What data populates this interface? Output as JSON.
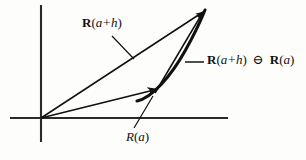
{
  "figure": {
    "kind": "vector-derivative-diagram",
    "background_color": "#fdfdfb",
    "ink_color": "#111111",
    "axes": {
      "vertical": {
        "x": 41,
        "y_top": 5,
        "y_bottom": 142
      },
      "horizontal": {
        "y": 118,
        "x_left": 10,
        "x_right": 228
      },
      "origin": {
        "x": 41,
        "y": 118
      }
    },
    "vectors": [
      {
        "name": "R(a+h)",
        "from": {
          "x": 41,
          "y": 118
        },
        "to": {
          "x": 205,
          "y": 10
        },
        "arrowhead": true
      },
      {
        "name": "R(a)",
        "from": {
          "x": 41,
          "y": 118
        },
        "to": {
          "x": 160,
          "y": 88
        },
        "arrowhead": true
      },
      {
        "name": "R(a+h) minus R(a)",
        "from": {
          "x": 160,
          "y": 88
        },
        "to": {
          "x": 205,
          "y": 10
        },
        "arrowhead": true
      }
    ],
    "curve": {
      "name": "trajectory-curve",
      "start": {
        "x": 137,
        "y": 101
      },
      "end": {
        "x": 205,
        "y": 10
      },
      "stroke_width": 3
    }
  },
  "labels": {
    "vector_a_plus_h": {
      "bold_symbol": "R",
      "open_paren": "(",
      "arg": "a+h",
      "close_paren": ")"
    },
    "difference": {
      "bold_symbol_1": "R",
      "open_paren_1": "(",
      "arg_1": "a+h",
      "close_paren_1": ")",
      "operator": "⊖",
      "bold_symbol_2": "R",
      "open_paren_2": "(",
      "arg_2": "a",
      "close_paren_2": ")"
    },
    "vector_a": {
      "symbol": "R",
      "open_paren": "(",
      "arg": "a",
      "close_paren": ")"
    }
  },
  "leader_lines": [
    {
      "name": "leader-to-vector-a-plus-h",
      "from": {
        "x": 112,
        "y": 36
      },
      "to": {
        "x": 134,
        "y": 59
      }
    },
    {
      "name": "leader-to-difference-vector",
      "from": {
        "x": 204,
        "y": 62
      },
      "to": {
        "x": 185,
        "y": 62
      }
    },
    {
      "name": "leader-to-vector-a",
      "from": {
        "x": 153,
        "y": 96
      },
      "to": {
        "x": 134,
        "y": 128
      }
    }
  ]
}
